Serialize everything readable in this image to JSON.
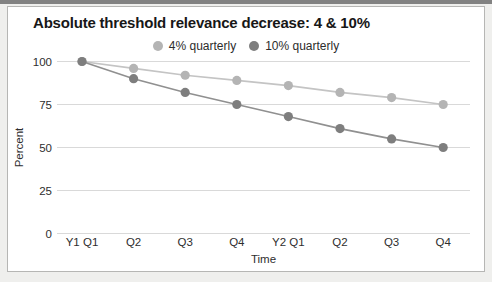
{
  "page": {
    "background_color": "#efefed",
    "top_edge_color": "#828282",
    "card_border_color": "#b6b6b4"
  },
  "chart_data": {
    "type": "line",
    "title": "Absolute threshold relevance decrease: 4 & 10%",
    "xlabel": "Time",
    "ylabel": "Percent",
    "categories": [
      "Y1 Q1",
      "Q2",
      "Q3",
      "Q4",
      "Y2 Q1",
      "Q2",
      "Q3",
      "Q4"
    ],
    "series": [
      {
        "name": "4% quarterly",
        "line_color": "#c4c4c4",
        "point_color": "#b4b4b4",
        "values": [
          100,
          96,
          92,
          89,
          86,
          82,
          79,
          75
        ]
      },
      {
        "name": "10% quarterly",
        "line_color": "#909090",
        "point_color": "#7e7e7e",
        "values": [
          100,
          90,
          82,
          75,
          68,
          61,
          55,
          50
        ]
      }
    ],
    "ylim": [
      0,
      100
    ],
    "yticks": [
      100,
      75,
      50,
      25,
      0
    ],
    "grid": true,
    "gridline_color": "#d9d9d9",
    "legend_position": "top-center",
    "text_color": "#2e2e2e"
  }
}
